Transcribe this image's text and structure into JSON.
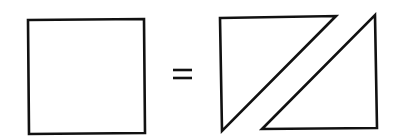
{
  "diagram": {
    "stroke_color": "#111111",
    "background_color": "#ffffff",
    "elements": [
      {
        "type": "square",
        "label": "square"
      },
      {
        "type": "equals-sign",
        "label": "="
      },
      {
        "type": "triangle",
        "label": "upper-left triangle"
      },
      {
        "type": "triangle",
        "label": "lower-right triangle"
      }
    ]
  }
}
